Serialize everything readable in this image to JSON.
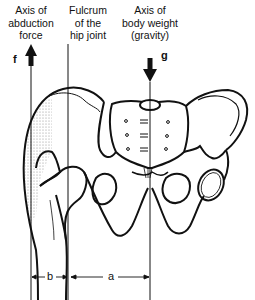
{
  "diagram": {
    "labels": {
      "abduction_axis": [
        "Axis of",
        "abduction",
        "force"
      ],
      "fulcrum": [
        "Fulcrum",
        "of the",
        "hip joint"
      ],
      "body_weight_axis": [
        "Axis of",
        "body weight",
        "(gravity)"
      ]
    },
    "arrows": {
      "abduction_force": {
        "symbol": "f",
        "direction": "up"
      },
      "gravity": {
        "symbol": "g",
        "direction": "down"
      }
    },
    "dimensions": {
      "b": {
        "label": "b",
        "description": "lever arm of abduction force"
      },
      "a": {
        "label": "a",
        "description": "lever arm of body weight"
      }
    },
    "colors": {
      "line": "#111111",
      "background": "#ffffff",
      "stipple": "#9a9a9a"
    }
  }
}
